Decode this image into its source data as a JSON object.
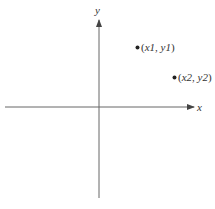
{
  "diagram": {
    "axes": {
      "x_label": "x",
      "y_label": "y",
      "color": "#555555"
    },
    "points": [
      {
        "x_var": "x1",
        "y_var": "y1",
        "open": "(",
        "sep": ", ",
        "close": ")"
      },
      {
        "x_var": "x2",
        "y_var": "y2",
        "open": "(",
        "sep": ", ",
        "close": ")"
      }
    ]
  }
}
